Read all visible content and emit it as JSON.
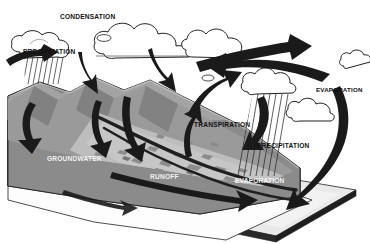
{
  "diagram": {
    "type": "water-cycle-block-diagram",
    "canvas": {
      "width": 370,
      "height": 244
    },
    "palette": {
      "background": "#ffffff",
      "arrow": "#1a1a1a",
      "outline": "#1a1a1a",
      "land_block_face": "#7a7a7a",
      "land_block_side": "#6d6d6d",
      "land_top": "#8e8e8e",
      "mountain_light": "#a8a8a8",
      "mountain_mid": "#949494",
      "mountain_shadow": "#6b6b6b",
      "valley_floor": "#b4b4b4",
      "water_slab_top": "#e8e8e8",
      "water_slab_edge": "#cfcfcf",
      "water_slab_dark": "#2a2a2a",
      "cloud_fill": "#ffffff",
      "rain_stroke": "#2b2b2b",
      "label_dark": "#111111",
      "label_light": "#f2f2f2"
    }
  },
  "labels": [
    {
      "id": "condensation",
      "text": "CONDENSATION",
      "x": 60,
      "y": 14,
      "tone": "dark",
      "size": "lbl-65"
    },
    {
      "id": "precipitation-left",
      "text": "PRECIPITATION",
      "x": 23,
      "y": 49,
      "tone": "dark",
      "size": "lbl-65"
    },
    {
      "id": "evaporation-right",
      "text": "EVAPORATION",
      "x": 316,
      "y": 87,
      "tone": "dark",
      "size": "lbl-6"
    },
    {
      "id": "transpiration",
      "text": "TRANSPIRATION",
      "x": 194,
      "y": 122,
      "tone": "dark",
      "size": "lbl-65"
    },
    {
      "id": "precipitation-right",
      "text": "PRECIPITATION",
      "x": 257,
      "y": 143,
      "tone": "dark",
      "size": "lbl-65"
    },
    {
      "id": "groundwater",
      "text": "GROUNDWATER",
      "x": 47,
      "y": 156,
      "tone": "light",
      "size": "lbl-65"
    },
    {
      "id": "runoff",
      "text": "RUNOFF",
      "x": 150,
      "y": 174,
      "tone": "light",
      "size": "lbl-65"
    },
    {
      "id": "evaporation-bottom",
      "text": "EVAPORATION",
      "x": 235,
      "y": 178,
      "tone": "light",
      "size": "lbl-65"
    }
  ],
  "processes": [
    {
      "name": "condensation",
      "description": "Water vapor cools and forms clouds"
    },
    {
      "name": "precipitation",
      "description": "Rain falls from clouds to land and sea"
    },
    {
      "name": "evaporation",
      "description": "Water rises from ocean and land surfaces"
    },
    {
      "name": "transpiration",
      "description": "Water vapor released from vegetation"
    },
    {
      "name": "runoff",
      "description": "Surface water flows downhill to the sea"
    },
    {
      "name": "groundwater",
      "description": "Water stored and moving beneath the surface"
    }
  ],
  "features": [
    {
      "name": "land-block",
      "kind": "terrain"
    },
    {
      "name": "mountain-range",
      "kind": "terrain"
    },
    {
      "name": "river-valley",
      "kind": "terrain"
    },
    {
      "name": "ocean-slab",
      "kind": "water"
    },
    {
      "name": "cloud-bank-left",
      "kind": "cloud"
    },
    {
      "name": "cloud-bank-top",
      "kind": "cloud"
    },
    {
      "name": "cloud-rain-right",
      "kind": "cloud"
    },
    {
      "name": "cloud-small-sea",
      "kind": "cloud"
    }
  ]
}
